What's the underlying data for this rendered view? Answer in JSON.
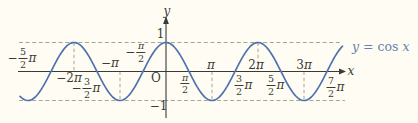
{
  "figure": {
    "background_color": "#fffdf3",
    "curve_color": "#4f73ad",
    "equation_color": "#6283ac",
    "axis_color": "#3a3a3a",
    "dashed_color": "#9b9b94",
    "text_color": "#3b3b3b"
  },
  "equation": {
    "lhs": "y",
    "relation": "=",
    "func": "cos",
    "arg": "x",
    "full": "y = cos x"
  },
  "axes": {
    "x_label": "x",
    "y_label": "y",
    "origin_label": "O",
    "y_tick_top": "1",
    "y_tick_bottom": "−1"
  },
  "x_ticks": [
    {
      "value_pi": -2.5,
      "pre": "−",
      "num": "5",
      "den": "2",
      "post": "π",
      "dx": -29,
      "dy": -13.5
    },
    {
      "value_pi": -2,
      "pre": "−2",
      "post": "π",
      "dx": -5,
      "dy": 6
    },
    {
      "value_pi": -1.5,
      "pre": "−",
      "num": "3",
      "den": "2",
      "post": "π",
      "dx": -11,
      "dy": 16.5
    },
    {
      "value_pi": -1,
      "pre": "−",
      "post": "π",
      "dx": -10,
      "dy": -8.5
    },
    {
      "value_pi": -0.5,
      "pre": "−",
      "num": "π",
      "den": "2",
      "dx": -7,
      "dy": -19.5
    },
    {
      "value_pi": 0.5,
      "num": "π",
      "den": "2",
      "dx": -4,
      "dy": 12
    },
    {
      "value_pi": 1,
      "post": "π",
      "dx": -1,
      "dy": -6.5
    },
    {
      "value_pi": 1.5,
      "num": "3",
      "den": "2",
      "post": "π",
      "dx": 8,
      "dy": 13.5
    },
    {
      "value_pi": 2,
      "pre": "2",
      "post": "π",
      "dx": -2,
      "dy": -6.5
    },
    {
      "value_pi": 2.5,
      "num": "5",
      "den": "2",
      "post": "π",
      "dx": -6,
      "dy": 13.5
    },
    {
      "value_pi": 3,
      "pre": "3",
      "post": "π",
      "dx": 0,
      "dy": -6.5
    },
    {
      "value_pi": 3.5,
      "num": "7",
      "den": "2",
      "post": "π",
      "dx": 8,
      "dy": 15.5
    }
  ],
  "chart_data": {
    "type": "line",
    "title": "y = cos x",
    "function": "y = cos(x)",
    "xlabel": "x",
    "ylabel": "y",
    "x_domain_pi": [
      -3.17,
      3.85
    ],
    "ylim": [
      -1,
      1
    ],
    "amplitude": 1,
    "period_pi": 2,
    "x_tick_values_pi": [
      -2.5,
      -2,
      -1.5,
      -1,
      -0.5,
      0.5,
      1,
      1.5,
      2,
      2.5,
      3,
      3.5
    ],
    "y_tick_values": [
      1,
      -1
    ],
    "maxima_pi": [
      -2,
      0,
      2
    ],
    "minima_pi": [
      -3,
      -1,
      1,
      3
    ],
    "zeros_pi": [
      -2.5,
      -1.5,
      -0.5,
      0.5,
      1.5,
      2.5,
      3.5
    ],
    "guide_lines_pi": [
      -2,
      -1,
      1,
      2,
      3
    ],
    "dashed_horizontals_y": [
      1,
      -1
    ],
    "legend_position": "right",
    "series": [
      {
        "name": "y = cos x",
        "x_pi": [
          -3,
          -2.5,
          -2,
          -1.5,
          -1,
          -0.5,
          0,
          0.5,
          1,
          1.5,
          2,
          2.5,
          3,
          3.5
        ],
        "y": [
          -1,
          0,
          1,
          0,
          -1,
          0,
          1,
          0,
          -1,
          0,
          1,
          0,
          -1,
          0
        ]
      }
    ]
  }
}
